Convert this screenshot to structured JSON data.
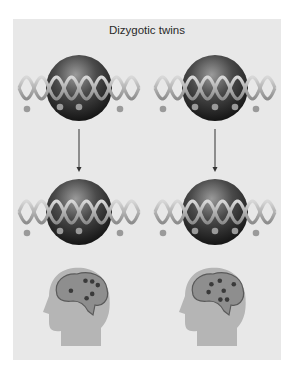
{
  "title": "Dizygotic twins",
  "colors": {
    "background": "#e8e8e8",
    "sphere_dark": "#1a1a1a",
    "sphere_light": "#8a8a8a",
    "strand": "#b8b8b8",
    "bead": "#9a9a9a",
    "arrow": "#333333",
    "head": "#b5b5b5",
    "brain": "#8e8e8e",
    "brain_outline": "#5a5a5a",
    "brain_dot": "#3a3a3a"
  },
  "columns": [
    {
      "name": "twin-1",
      "top_beads_inside": 2,
      "bottom_beads_inside": 2,
      "brain_dots": [
        [
          0.58,
          0.22
        ],
        [
          0.7,
          0.24
        ],
        [
          0.8,
          0.32
        ],
        [
          0.32,
          0.45
        ],
        [
          0.7,
          0.52
        ],
        [
          0.6,
          0.62
        ]
      ]
    },
    {
      "name": "twin-2",
      "top_beads_inside": 3,
      "bottom_beads_inside": 3,
      "brain_dots": [
        [
          0.4,
          0.3
        ],
        [
          0.55,
          0.22
        ],
        [
          0.8,
          0.3
        ],
        [
          0.35,
          0.48
        ],
        [
          0.62,
          0.45
        ],
        [
          0.56,
          0.65
        ],
        [
          0.68,
          0.65
        ]
      ]
    }
  ]
}
